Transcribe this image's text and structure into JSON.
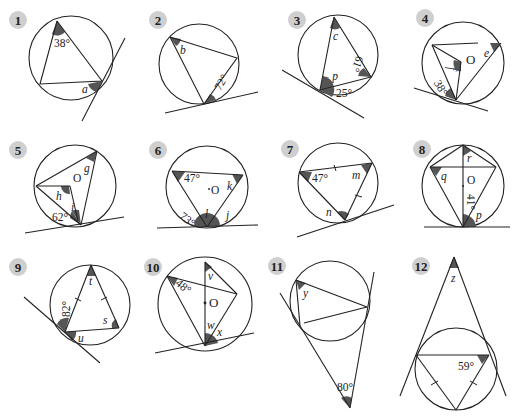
{
  "exercise": {
    "description": "Circle theorem exercises: find the labelled angles (tangent/chord, angles in same segment, angles at centre).",
    "accent_colors": {
      "badge": "#cfcfcf",
      "angle_shade": "#555555",
      "line": "#222222"
    }
  },
  "diagrams": [
    {
      "number": "1",
      "labels": [
        "38°",
        "a"
      ]
    },
    {
      "number": "2",
      "labels": [
        "b",
        "72°"
      ]
    },
    {
      "number": "3",
      "labels": [
        "c",
        "61°",
        "d",
        "25°"
      ]
    },
    {
      "number": "4",
      "labels": [
        "e",
        "f",
        "O",
        "38°"
      ]
    },
    {
      "number": "5",
      "labels": [
        "g",
        "h",
        "O",
        "i",
        "62°"
      ]
    },
    {
      "number": "6",
      "labels": [
        "47°",
        "k",
        "O",
        "l",
        "73°",
        "j"
      ]
    },
    {
      "number": "7",
      "labels": [
        "47°",
        "m",
        "n"
      ]
    },
    {
      "number": "8",
      "labels": [
        "r",
        "q",
        "O",
        "41°",
        "p"
      ]
    },
    {
      "number": "9",
      "labels": [
        "t",
        "82°",
        "s",
        "u"
      ]
    },
    {
      "number": "10",
      "labels": [
        "v",
        "48°",
        "O",
        "w",
        "x"
      ]
    },
    {
      "number": "11",
      "labels": [
        "y",
        "80°"
      ]
    },
    {
      "number": "12",
      "labels": [
        "z",
        "59°"
      ]
    }
  ]
}
